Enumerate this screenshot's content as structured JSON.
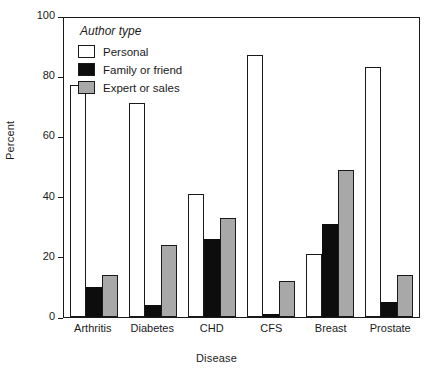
{
  "chart_data": {
    "type": "bar",
    "title": "",
    "xlabel": "Disease",
    "ylabel": "Percent",
    "categories": [
      "Arthritis",
      "Diabetes",
      "CHD",
      "CFS",
      "Breast",
      "Prostate"
    ],
    "series": [
      {
        "name": "Personal",
        "color": "#ffffff",
        "values": [
          77,
          71,
          41,
          87,
          21,
          83
        ]
      },
      {
        "name": "Family or friend",
        "color": "#000000",
        "values": [
          10,
          4,
          26,
          1,
          31,
          5
        ]
      },
      {
        "name": "Expert or sales",
        "color": "#a8a8a8",
        "values": [
          14,
          24,
          33,
          12,
          49,
          14
        ]
      }
    ],
    "ylim": [
      0,
      100
    ],
    "yticks": [
      0,
      20,
      40,
      60,
      80,
      100
    ],
    "ytick_labels": [
      "0",
      "20",
      "40",
      "60",
      "80",
      "100"
    ],
    "grid": false,
    "legend_position": "top-left",
    "legend_title": "Author type"
  },
  "legend": {
    "title": "Author type",
    "items": [
      {
        "label": "Personal"
      },
      {
        "label": "Family or friend"
      },
      {
        "label": "Expert or sales"
      }
    ]
  },
  "axes": {
    "y_title": "Percent",
    "x_title": "Disease"
  }
}
